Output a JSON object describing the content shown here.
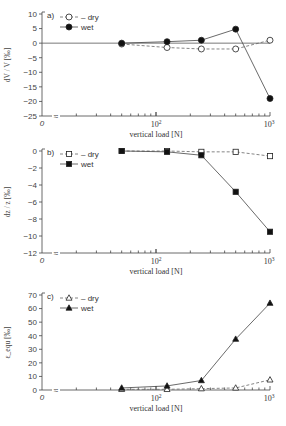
{
  "chart_data": [
    {
      "type": "line",
      "panel": "a)",
      "title": "",
      "xlabel": "vertical load [N]",
      "ylabel": "dV / V [‰]",
      "xscale": "log",
      "x_ticks": [
        "0",
        "10²",
        "10³"
      ],
      "y_ticks": [
        10,
        5,
        0,
        -5,
        -10,
        -15,
        -20,
        -25
      ],
      "ylim": [
        -25,
        10
      ],
      "x": [
        50,
        125,
        250,
        500,
        1000
      ],
      "series": [
        {
          "name": "dry",
          "marker": "open-circle",
          "linestyle": "dashed",
          "values": [
            -0.3,
            -1.5,
            -2,
            -2,
            1
          ]
        },
        {
          "name": "wet",
          "marker": "filled-circle",
          "linestyle": "solid",
          "values": [
            0,
            0.5,
            1,
            4.8,
            -19
          ]
        }
      ],
      "legend_position": "upper-left",
      "grid": false,
      "zero_line": true
    },
    {
      "type": "line",
      "panel": "b)",
      "title": "",
      "xlabel": "vertical load [N]",
      "ylabel": "dz / z [‰]",
      "xscale": "log",
      "x_ticks": [
        "0",
        "10²",
        "10³"
      ],
      "y_ticks": [
        0,
        -2,
        -4,
        -6,
        -8,
        -10,
        -12
      ],
      "ylim": [
        -12,
        0
      ],
      "x": [
        50,
        125,
        250,
        500,
        1000
      ],
      "series": [
        {
          "name": "dry",
          "marker": "open-square",
          "linestyle": "dashed",
          "values": [
            0,
            0,
            -0.1,
            -0.1,
            -0.6
          ]
        },
        {
          "name": "wet",
          "marker": "filled-square",
          "linestyle": "solid",
          "values": [
            0,
            -0.1,
            -0.5,
            -4.8,
            -9.5
          ]
        }
      ],
      "legend_position": "upper-left",
      "grid": false
    },
    {
      "type": "line",
      "panel": "c)",
      "title": "",
      "xlabel": "vertical load [N]",
      "ylabel": "ε_equ [‰]",
      "xscale": "log",
      "x_ticks": [
        "0",
        "10²",
        "10³"
      ],
      "y_ticks": [
        70,
        60,
        50,
        40,
        30,
        20,
        10,
        0
      ],
      "ylim": [
        0,
        70
      ],
      "x": [
        50,
        125,
        250,
        500,
        1000
      ],
      "series": [
        {
          "name": "dry",
          "marker": "open-triangle",
          "linestyle": "dashed",
          "values": [
            0.5,
            0.5,
            1,
            1.5,
            7.5
          ]
        },
        {
          "name": "wet",
          "marker": "filled-triangle",
          "linestyle": "solid",
          "values": [
            1.5,
            3,
            7,
            37.5,
            64
          ]
        }
      ],
      "legend_position": "upper-left",
      "grid": false
    }
  ],
  "panels": [
    {
      "tag": "a)",
      "ylabel": "dV / V [‰]",
      "xlabel": "vertical load [N]",
      "legend": [
        "dry",
        "wet"
      ],
      "yticks": [
        "10",
        "5",
        "0",
        "−5",
        "−10",
        "−15",
        "−20",
        "−25"
      ],
      "xticks": [
        "0",
        "10²",
        "10³"
      ]
    },
    {
      "tag": "b)",
      "ylabel": "dz / z [‰]",
      "xlabel": "vertical load [N]",
      "legend": [
        "dry",
        "wet"
      ],
      "yticks": [
        "0",
        "−2",
        "−4",
        "−6",
        "−8",
        "−10",
        "−12"
      ],
      "xticks": [
        "0",
        "10²",
        "10³"
      ]
    },
    {
      "tag": "c)",
      "ylabel": "ε_equ [‰]",
      "xlabel": "vertical load [N]",
      "legend": [
        "dry",
        "wet"
      ],
      "yticks": [
        "70",
        "60",
        "50",
        "40",
        "30",
        "20",
        "10",
        "0"
      ],
      "xticks": [
        "0",
        "10²",
        "10³"
      ]
    }
  ]
}
